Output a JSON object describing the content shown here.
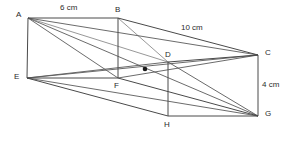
{
  "figure": {
    "kind": "cuboid-oblique-projection",
    "width": 289,
    "height": 142,
    "background": "#ffffff",
    "edge_color": "#4a4a4a",
    "diagonal_color": "#5a5a5a",
    "hidden_edge_color": "#8c8c8c",
    "marker_color": "#1a1a1a",
    "text_color": "#2b2b2b"
  },
  "vertices": [
    {
      "id": "A",
      "label": "A",
      "x": 28,
      "y": 18,
      "label_x": 16,
      "label_y": 11
    },
    {
      "id": "B",
      "label": "B",
      "x": 118,
      "y": 18,
      "label_x": 115,
      "label_y": 6
    },
    {
      "id": "C",
      "label": "C",
      "x": 258,
      "y": 55,
      "label_x": 265,
      "label_y": 49
    },
    {
      "id": "D",
      "label": "D",
      "x": 168,
      "y": 62,
      "label_x": 165,
      "label_y": 51
    },
    {
      "id": "E",
      "label": "E",
      "x": 27,
      "y": 78,
      "label_x": 14,
      "label_y": 73
    },
    {
      "id": "F",
      "label": "F",
      "x": 118,
      "y": 78,
      "label_x": 114,
      "label_y": 82
    },
    {
      "id": "G",
      "label": "G",
      "x": 258,
      "y": 116,
      "label_x": 265,
      "label_y": 110
    },
    {
      "id": "H",
      "label": "H",
      "x": 168,
      "y": 116,
      "label_x": 164,
      "label_y": 121
    }
  ],
  "edges": [
    {
      "name": "edge-AB",
      "from": "A",
      "to": "B",
      "style": "solid"
    },
    {
      "name": "edge-BC",
      "from": "B",
      "to": "C",
      "style": "solid"
    },
    {
      "name": "edge-DC",
      "from": "D",
      "to": "C",
      "style": "solid"
    },
    {
      "name": "edge-AE",
      "from": "A",
      "to": "E",
      "style": "solid"
    },
    {
      "name": "edge-BF",
      "from": "B",
      "to": "F",
      "style": "solid"
    },
    {
      "name": "edge-EF",
      "from": "E",
      "to": "F",
      "style": "solid"
    },
    {
      "name": "edge-FG",
      "from": "F",
      "to": "G",
      "style": "solid"
    },
    {
      "name": "edge-EH-base",
      "from": "E",
      "to": "H",
      "style": "solid"
    },
    {
      "name": "edge-HG",
      "from": "H",
      "to": "G",
      "style": "solid"
    },
    {
      "name": "edge-CG",
      "from": "C",
      "to": "G",
      "style": "solid"
    },
    {
      "name": "edge-DH",
      "from": "D",
      "to": "H",
      "style": "solid"
    },
    {
      "name": "edge-AD-hidden",
      "from": "A",
      "to": "D",
      "style": "hidden"
    },
    {
      "name": "edge-BD-hidden",
      "from": "B",
      "to": "D",
      "style": "hidden"
    }
  ],
  "diagonals": [
    {
      "name": "diagonal-AC",
      "from": "A",
      "to": "C"
    },
    {
      "name": "diagonal-AG",
      "from": "A",
      "to": "G"
    },
    {
      "name": "diagonal-AF",
      "from": "A",
      "to": "F"
    },
    {
      "name": "diagonal-EC",
      "from": "E",
      "to": "C"
    },
    {
      "name": "diagonal-EG",
      "from": "E",
      "to": "G"
    },
    {
      "name": "diagonal-ED",
      "from": "E",
      "to": "D"
    },
    {
      "name": "diagonal-FC",
      "from": "F",
      "to": "C"
    },
    {
      "name": "diagonal-DG",
      "from": "D",
      "to": "G"
    }
  ],
  "markers": [
    {
      "name": "centre-point",
      "x": 145,
      "y": 69,
      "r": 2.3
    }
  ],
  "dimensions": [
    {
      "name": "dimension-ab",
      "text": "6 cm",
      "x": 60,
      "y": 4
    },
    {
      "name": "dimension-bc",
      "text": "10 cm",
      "x": 181,
      "y": 24
    },
    {
      "name": "dimension-cg",
      "text": "4 cm",
      "x": 262,
      "y": 81
    }
  ]
}
